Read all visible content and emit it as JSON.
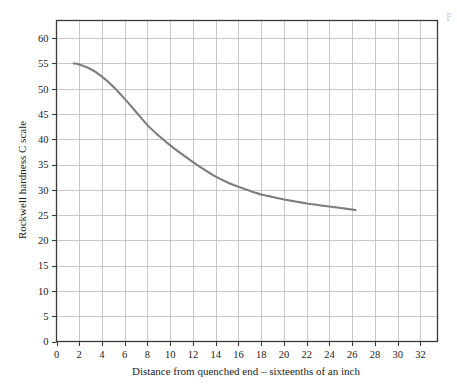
{
  "figure": {
    "corner_mark": "F",
    "curve_color": "#7d7d7d",
    "grid_color": "#b9b9b9",
    "frame_color": "#3a3a3a",
    "background": "#ffffff"
  },
  "chart_data": {
    "type": "line",
    "title": "",
    "subtitle": "",
    "xlabel": "Distance from quenched end – sixteenths of an inch",
    "ylabel": "Rockwell hardness C scale",
    "xlim": [
      0,
      33.5
    ],
    "ylim": [
      0,
      63.5
    ],
    "xticks": [
      0,
      2,
      4,
      6,
      8,
      10,
      12,
      14,
      16,
      18,
      20,
      22,
      24,
      26,
      28,
      30,
      32
    ],
    "xtick_labels": [
      "0",
      "2",
      "4",
      "6",
      "8",
      "10",
      "12",
      "14",
      "16",
      "18",
      "20",
      "22",
      "24",
      "26",
      "28",
      "30",
      "32"
    ],
    "yticks": [
      0,
      5,
      10,
      15,
      20,
      25,
      30,
      35,
      40,
      45,
      50,
      55,
      60
    ],
    "ytick_labels": [
      "0",
      "5",
      "10",
      "15",
      "20",
      "25",
      "30",
      "35",
      "40",
      "45",
      "50",
      "55",
      "60"
    ],
    "grid": true,
    "grid_x_step": 2,
    "grid_y_step": 5,
    "legend": null,
    "legend_position": "none",
    "annotations": [],
    "series": [
      {
        "name": "Jominy hardenability curve",
        "color": "#7d7d7d",
        "x": [
          1.5,
          2,
          3,
          4,
          5,
          6,
          7,
          8,
          9,
          10,
          11,
          12,
          13,
          14,
          15,
          16,
          17,
          18,
          19,
          20,
          21,
          22,
          23,
          24,
          25,
          26.3
        ],
        "values": [
          55.0,
          54.8,
          53.9,
          52.4,
          50.4,
          48.0,
          45.4,
          42.8,
          40.7,
          38.8,
          37.1,
          35.5,
          34.0,
          32.6,
          31.5,
          30.6,
          29.8,
          29.1,
          28.6,
          28.1,
          27.7,
          27.3,
          27.0,
          26.7,
          26.4,
          26.0
        ]
      }
    ]
  }
}
